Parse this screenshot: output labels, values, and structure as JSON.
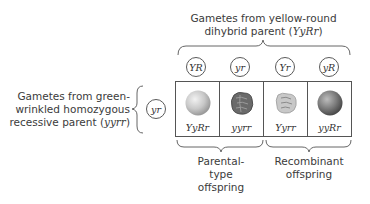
{
  "top_parent": {
    "line1": "Gametes from yellow-round",
    "line2_prefix": "dihybrid parent (",
    "genotype": "YyRr",
    "line2_suffix": ")"
  },
  "left_parent": {
    "line1": "Gametes from green-",
    "line2": "wrinkled homozygous",
    "line3_prefix": "recessive parent (",
    "genotype": "yyrr",
    "line3_suffix": ")",
    "gamete": "yr"
  },
  "top_gametes": [
    "YR",
    "yr",
    "Yr",
    "yR"
  ],
  "offspring": [
    {
      "genotype": "YyRr",
      "phenotype": "yellow-round",
      "pea_color": "#c9c9c9",
      "shape": "round"
    },
    {
      "genotype": "yyrr",
      "phenotype": "green-wrinkled",
      "pea_color": "#6e6e6e",
      "shape": "wrinkled"
    },
    {
      "genotype": "Yyrr",
      "phenotype": "yellow-wrinkled",
      "pea_color": "#c4c4c4",
      "shape": "wrinkled"
    },
    {
      "genotype": "yyRr",
      "phenotype": "green-round",
      "pea_color": "#7a7a7a",
      "shape": "round"
    }
  ],
  "groups": {
    "parental": {
      "line1": "Parental-",
      "line2": "type",
      "line3": "offspring"
    },
    "recombinant": {
      "line1": "Recombinant",
      "line2": "offspring"
    }
  }
}
